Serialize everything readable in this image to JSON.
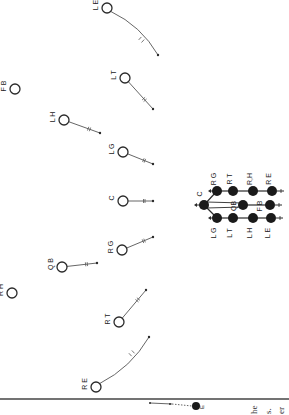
{
  "diagram": {
    "type": "football-play-diagram",
    "orientation": "rotated-90",
    "colors": {
      "ink": "#2a2a2a",
      "line": "#555555",
      "background": "#ffffff",
      "rule": "#444444"
    },
    "players": [
      {
        "id": "LE",
        "label": "L E",
        "x": 107,
        "y": 8,
        "path_end": [
          158,
          55
        ],
        "curved": true
      },
      {
        "id": "LT",
        "label": "L T",
        "x": 125,
        "y": 78,
        "path_end": [
          153,
          109
        ],
        "curved": false
      },
      {
        "id": "FB",
        "label": "F B",
        "x": 15,
        "y": 89,
        "path_end": null
      },
      {
        "id": "LH",
        "label": "L H",
        "x": 64,
        "y": 120,
        "path_end": [
          100,
          133
        ],
        "curved": false
      },
      {
        "id": "LG",
        "label": "L G",
        "x": 123,
        "y": 152,
        "path_end": [
          153,
          164
        ],
        "curved": false
      },
      {
        "id": "C",
        "label": "C",
        "x": 123,
        "y": 201,
        "path_end": [
          153,
          201
        ],
        "curved": false
      },
      {
        "id": "RG",
        "label": "R G",
        "x": 122,
        "y": 250,
        "path_end": [
          153,
          237
        ],
        "curved": false
      },
      {
        "id": "QB",
        "label": "Q B",
        "x": 62,
        "y": 267,
        "path_end": [
          97,
          263
        ],
        "curved": false
      },
      {
        "id": "RH",
        "label": "R H",
        "x": 12,
        "y": 293,
        "path_end": null
      },
      {
        "id": "RT",
        "label": "R T",
        "x": 119,
        "y": 322,
        "path_end": [
          146,
          290
        ],
        "curved": false
      },
      {
        "id": "RE",
        "label": "R E",
        "x": 96,
        "y": 387,
        "path_end": [
          149,
          337
        ],
        "curved": true
      }
    ],
    "formation": {
      "dots": [
        {
          "id": "C",
          "label": "C",
          "x": 204,
          "y": 205
        },
        {
          "id": "RG",
          "label": "R G",
          "x": 217,
          "y": 191
        },
        {
          "id": "RT",
          "label": "R T",
          "x": 233,
          "y": 191
        },
        {
          "id": "RH",
          "label": "R,H",
          "x": 253,
          "y": 191
        },
        {
          "id": "RE",
          "label": "R E",
          "x": 272,
          "y": 191
        },
        {
          "id": "LG",
          "label": "L G",
          "x": 217,
          "y": 218
        },
        {
          "id": "LT",
          "label": "L T",
          "x": 233,
          "y": 218
        },
        {
          "id": "LH",
          "label": "L H",
          "x": 253,
          "y": 218
        },
        {
          "id": "LE",
          "label": "L E",
          "x": 271,
          "y": 218
        },
        {
          "id": "QB",
          "label": "QB",
          "x": 243,
          "y": 205
        },
        {
          "id": "FB",
          "label": "F B",
          "x": 270,
          "y": 205
        }
      ]
    },
    "legend": {
      "dot": {
        "x": 196,
        "y": 406
      },
      "line_start": [
        150,
        403
      ],
      "label": "E"
    },
    "divider_y": 399,
    "text_fragments": [
      "he",
      "s.",
      "er"
    ]
  }
}
